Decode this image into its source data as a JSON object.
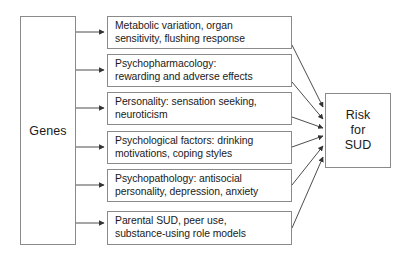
{
  "diagram": {
    "source_node": {
      "label": "Genes"
    },
    "mediator_nodes": [
      {
        "id": "metabolic",
        "line1": "Metabolic variation, organ",
        "line2": "sensitivity, flushing response"
      },
      {
        "id": "psychopharmacology",
        "line1": "Psychopharmacology:",
        "line2": "rewarding and adverse effects"
      },
      {
        "id": "personality",
        "line1": "Personality: sensation seeking,",
        "line2": "neuroticism"
      },
      {
        "id": "psychological-factors",
        "line1": "Psychological factors: drinking",
        "line2": "motivations, coping styles"
      },
      {
        "id": "psychopathology",
        "line1": "Psychopathology: antisocial",
        "line2": "personality, depression, anxiety"
      },
      {
        "id": "parental-sud",
        "line1": "Parental SUD, peer use,",
        "line2": "substance-using role models"
      }
    ],
    "outcome_node": {
      "line1": "Risk",
      "line2": "for",
      "line3": "SUD"
    },
    "colors": {
      "background": "#ffffff",
      "box_border": "#8a8a8a",
      "text": "#1a1a1a",
      "connector": "#4d4d4d"
    }
  }
}
